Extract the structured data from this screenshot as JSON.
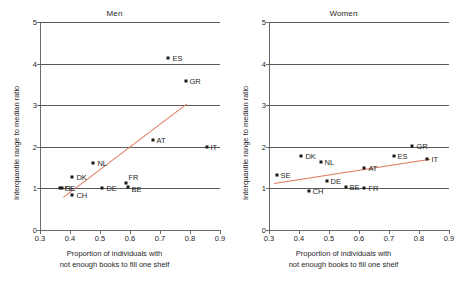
{
  "figure": {
    "x_axis_title_line1": "Proportion of individuals with",
    "x_axis_title_line2": "not enough books to fill one shelf",
    "y_axis_title": "Interquantile range to median ratio",
    "trend_color": "#e0785c",
    "point_color": "#181818",
    "grid_color": "#5b5b5b"
  },
  "chart_data": [
    {
      "type": "scatter",
      "title": "Men",
      "xlabel": "Proportion of individuals with not enough books to fill one shelf",
      "ylabel": "Interquantile range to median ratio",
      "xlim": [
        0.3,
        0.9
      ],
      "ylim": [
        0,
        5
      ],
      "xticks": [
        "0.3",
        "0.4",
        "0.5",
        "0.6",
        "0.7",
        "0.8",
        "0.9"
      ],
      "yticks": [
        "0",
        "1",
        "2",
        "3",
        "4",
        "5"
      ],
      "grid": "horizontal",
      "legend": "none",
      "points": [
        {
          "label": "ES",
          "x": 0.725,
          "y": 4.13,
          "label_dx": 5,
          "label_dy": -3
        },
        {
          "label": "GR",
          "x": 0.785,
          "y": 3.57,
          "label_dx": 4,
          "label_dy": -3
        },
        {
          "label": "AT",
          "x": 0.675,
          "y": 2.17,
          "label_dx": 4,
          "label_dy": -3
        },
        {
          "label": "IT",
          "x": 0.855,
          "y": 2.0,
          "label_dx": 4,
          "label_dy": -3
        },
        {
          "label": "NL",
          "x": 0.478,
          "y": 1.62,
          "label_dx": 4,
          "label_dy": -3
        },
        {
          "label": "DK",
          "x": 0.408,
          "y": 1.28,
          "label_dx": 4,
          "label_dy": -3
        },
        {
          "label": "FR",
          "x": 0.588,
          "y": 1.12,
          "label_dx": 2,
          "label_dy": -9
        },
        {
          "label": "BE",
          "x": 0.592,
          "y": 1.03,
          "label_dx": 4,
          "label_dy": -1
        },
        {
          "label": "SE",
          "x": 0.372,
          "y": 1.01,
          "label_dx": 4,
          "label_dy": -3
        },
        {
          "label": "FI",
          "x": 0.368,
          "y": 1.0,
          "label_dx": 4,
          "label_dy": -3
        },
        {
          "label": "DE",
          "x": 0.508,
          "y": 1.01,
          "label_dx": 4,
          "label_dy": -3
        },
        {
          "label": "CH",
          "x": 0.408,
          "y": 0.84,
          "label_dx": 4,
          "label_dy": -3
        }
      ],
      "trendline": {
        "x0": 0.375,
        "y0": 0.8,
        "x1": 0.788,
        "y1": 3.05
      }
    },
    {
      "type": "scatter",
      "title": "Women",
      "xlabel": "Proportion of individuals with not enough books to fill one shelf",
      "ylabel": "Interquantile range to median ratio",
      "xlim": [
        0.3,
        0.9
      ],
      "ylim": [
        0,
        5
      ],
      "xticks": [
        "0.3",
        "0.4",
        "0.5",
        "0.6",
        "0.7",
        "0.8",
        "0.9"
      ],
      "yticks": [
        "0",
        "1",
        "2",
        "3",
        "4",
        "5"
      ],
      "grid": "horizontal",
      "legend": "none",
      "points": [
        {
          "label": "GR",
          "x": 0.778,
          "y": 2.01,
          "label_dx": 4,
          "label_dy": -3
        },
        {
          "label": "ES",
          "x": 0.715,
          "y": 1.79,
          "label_dx": 4,
          "label_dy": -3
        },
        {
          "label": "IT",
          "x": 0.828,
          "y": 1.7,
          "label_dx": 4,
          "label_dy": -3
        },
        {
          "label": "DK",
          "x": 0.408,
          "y": 1.79,
          "label_dx": 4,
          "label_dy": -3
        },
        {
          "label": "NL",
          "x": 0.472,
          "y": 1.63,
          "label_dx": 4,
          "label_dy": -3
        },
        {
          "label": "AT",
          "x": 0.618,
          "y": 1.48,
          "label_dx": 4,
          "label_dy": -3
        },
        {
          "label": "SE",
          "x": 0.325,
          "y": 1.32,
          "label_dx": 4,
          "label_dy": -3
        },
        {
          "label": "DE",
          "x": 0.492,
          "y": 1.17,
          "label_dx": 4,
          "label_dy": -3
        },
        {
          "label": "BE",
          "x": 0.555,
          "y": 1.03,
          "label_dx": 4,
          "label_dy": -3
        },
        {
          "label": "FR",
          "x": 0.618,
          "y": 1.02,
          "label_dx": 4,
          "label_dy": -3
        },
        {
          "label": "CH",
          "x": 0.432,
          "y": 0.93,
          "label_dx": 4,
          "label_dy": -3
        }
      ],
      "trendline": {
        "x0": 0.318,
        "y0": 1.14,
        "x1": 0.838,
        "y1": 1.72
      }
    }
  ]
}
